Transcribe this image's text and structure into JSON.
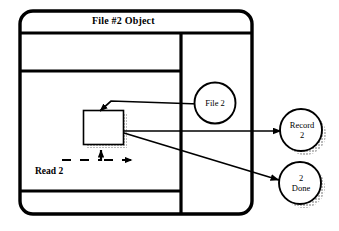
{
  "diagram": {
    "type": "object-interaction-diagram",
    "title": "File #2 Object",
    "frame": {
      "shape": "rounded-rectangle",
      "stroke_color": "#000000",
      "fill_color": "#ffffff",
      "title_bar_label": "File #2 Object"
    },
    "inner_box": {
      "label": "",
      "shape": "rectangle-with-shadow",
      "shadow_style": "hatched"
    },
    "control_flow": {
      "label": "Read 2",
      "line_style": "dashed",
      "arrow_into_box": true,
      "arrow_right": true
    },
    "nodes": [
      {
        "id": "file2",
        "label": "File 2",
        "lines": [
          "File 2"
        ],
        "shape": "circle-with-shadow",
        "position": "inside-right-column"
      },
      {
        "id": "record2",
        "label": "Record 2",
        "lines": [
          "Record",
          "2"
        ],
        "shape": "circle-with-shadow",
        "position": "outside-right-upper"
      },
      {
        "id": "done2",
        "label": "2 Done",
        "lines": [
          "2",
          "Done"
        ],
        "shape": "circle-with-shadow",
        "position": "outside-right-lower"
      }
    ],
    "connections": [
      {
        "from": "file2",
        "to": "inner-box",
        "arrow": "arrowhead-at-box-top"
      },
      {
        "from": "inner-box",
        "to": "record2",
        "arrow": "arrowhead-at-circle"
      },
      {
        "from": "inner-box",
        "to": "done2",
        "arrow": "arrowhead-at-circle"
      }
    ],
    "colors": {
      "stroke": "#000000",
      "fill": "#ffffff",
      "shadow": "#8a8a8a",
      "background": "#ffffff"
    }
  }
}
